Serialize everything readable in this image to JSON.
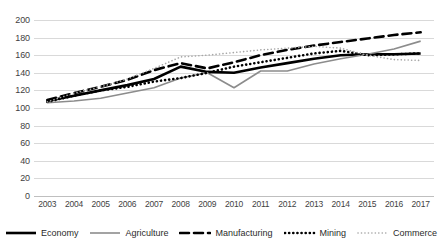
{
  "chart_data": {
    "type": "line",
    "title": "",
    "xlabel": "",
    "ylabel": "",
    "x": [
      2003,
      2004,
      2005,
      2006,
      2007,
      2008,
      2009,
      2010,
      2011,
      2012,
      2013,
      2014,
      2015,
      2016,
      2017
    ],
    "categories": [
      "2003",
      "2004",
      "2005",
      "2006",
      "2007",
      "2008",
      "2009",
      "2010",
      "2011",
      "2012",
      "2013",
      "2014",
      "2015",
      "2016",
      "2017"
    ],
    "ylim": [
      0,
      200
    ],
    "ytick_values": [
      0,
      20,
      40,
      60,
      80,
      100,
      120,
      140,
      160,
      180,
      200
    ],
    "ytick_labels": [
      "0",
      "20",
      "40",
      "60",
      "80",
      "100",
      "120",
      "140",
      "160",
      "180",
      "200"
    ],
    "grid": true,
    "legend_position": "bottom",
    "series": [
      {
        "name": "Economy",
        "style": "solid",
        "color": "#000000",
        "width": 2.6,
        "values": [
          108,
          114,
          120,
          126,
          133,
          147,
          141,
          140,
          146,
          151,
          156,
          160,
          161,
          161,
          162
        ]
      },
      {
        "name": "Agriculture",
        "style": "solid",
        "color": "#8c8c8c",
        "width": 1.6,
        "values": [
          106,
          108,
          111,
          117,
          123,
          134,
          140,
          123,
          142,
          142,
          150,
          156,
          161,
          167,
          176
        ]
      },
      {
        "name": "Manufacturing",
        "style": "dashed",
        "color": "#000000",
        "width": 2.6,
        "values": [
          109,
          117,
          124,
          132,
          143,
          151,
          145,
          152,
          160,
          166,
          171,
          175,
          179,
          183,
          186
        ]
      },
      {
        "name": "Mining",
        "style": "dotted",
        "color": "#000000",
        "width": 2.6,
        "values": [
          107,
          114,
          120,
          124,
          130,
          134,
          140,
          147,
          152,
          157,
          162,
          165,
          160,
          161,
          162
        ]
      },
      {
        "name": "Commerce",
        "style": "fine-dotted",
        "color": "#a6a6a6",
        "width": 1.6,
        "values": [
          107,
          117,
          124,
          133,
          145,
          158,
          160,
          163,
          166,
          168,
          170,
          168,
          160,
          155,
          154
        ]
      }
    ]
  },
  "legend": {
    "items": [
      {
        "label": "Economy"
      },
      {
        "label": "Agriculture"
      },
      {
        "label": "Manufacturing"
      },
      {
        "label": "Mining"
      },
      {
        "label": "Commerce"
      }
    ]
  }
}
